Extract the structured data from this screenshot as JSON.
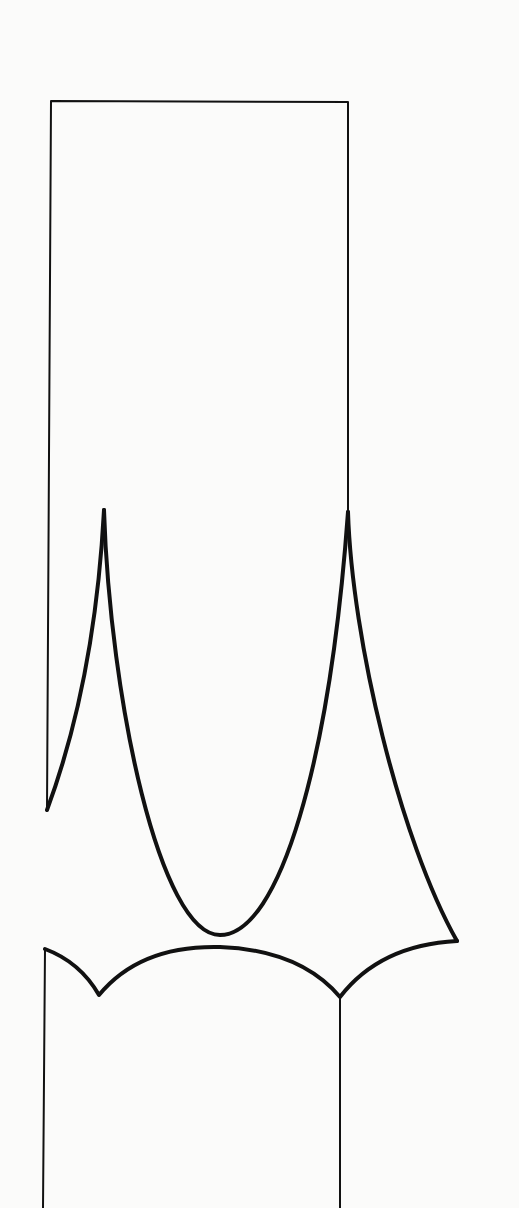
{
  "diagram": {
    "colors": {
      "background": "#fbfbfa",
      "stroke": "#111111"
    },
    "shapes": {
      "upper_rect": {
        "x1": 51,
        "y1": 101,
        "x2": 348
      },
      "left_cusp_top": [
        104,
        510
      ],
      "right_cusp_top": [
        348,
        512
      ],
      "bottom_u": [
        220,
        935
      ],
      "right_point": [
        457,
        941
      ],
      "lower_left_corner": [
        45,
        949
      ],
      "lower_cusp_left": [
        99,
        995
      ],
      "lower_cusp_right": [
        340,
        997
      ]
    }
  }
}
